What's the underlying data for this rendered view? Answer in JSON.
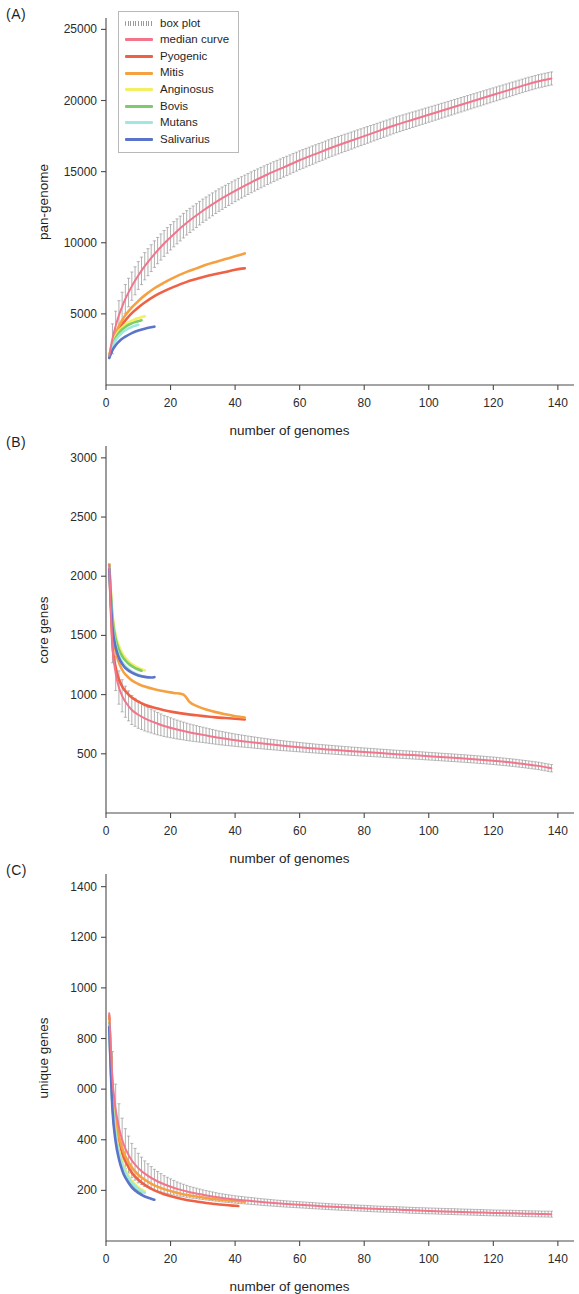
{
  "figure": {
    "xlabel": "number of genomes",
    "panels": [
      {
        "letter": "(A)",
        "ylabel": "pan-genome"
      },
      {
        "letter": "(B)",
        "ylabel": "core genes"
      },
      {
        "letter": "(C)",
        "ylabel": "unique genes"
      }
    ]
  },
  "legend": {
    "entries": [
      {
        "label": "box plot",
        "color": "#9a9a9a",
        "style": "boxplot"
      },
      {
        "label": "median curve",
        "color": "#f2758c",
        "style": "line"
      },
      {
        "label": "Pyogenic",
        "color": "#ef6145",
        "style": "line"
      },
      {
        "label": "Mitis",
        "color": "#f5a142",
        "style": "line"
      },
      {
        "label": "Anginosus",
        "color": "#f2ef62",
        "style": "line"
      },
      {
        "label": "Bovis",
        "color": "#7dcb6a",
        "style": "line"
      },
      {
        "label": "Mutans",
        "color": "#9fe8e0",
        "style": "line"
      },
      {
        "label": "Salivarius",
        "color": "#5b74c8",
        "style": "line"
      }
    ]
  },
  "chart_data": [
    {
      "panel": "A",
      "type": "line",
      "title": "pan-genome",
      "xlabel": "number of genomes",
      "ylabel": "pan-genome",
      "xlim": [
        0,
        145
      ],
      "ylim": [
        0,
        25800
      ],
      "xticks": [
        0,
        20,
        40,
        60,
        80,
        100,
        120,
        140
      ],
      "yticks": [
        5000,
        10000,
        15000,
        20000,
        25000
      ],
      "ytick_labels": [
        "5000",
        "10000",
        "15000",
        "20000",
        "25000"
      ],
      "grid": false,
      "legend_position": "top-left",
      "series": [
        {
          "name": "median curve",
          "color": "#f2758c",
          "has_boxplot": true,
          "x": [
            1,
            2,
            3,
            4,
            5,
            6,
            8,
            10,
            12,
            15,
            18,
            21,
            25,
            30,
            35,
            40,
            45,
            50,
            55,
            60,
            65,
            70,
            75,
            80,
            85,
            90,
            95,
            100,
            105,
            110,
            115,
            120,
            125,
            130,
            134,
            138
          ],
          "y": [
            2050,
            3250,
            4150,
            4900,
            5500,
            6050,
            6950,
            7700,
            8350,
            9200,
            9950,
            10600,
            11400,
            12250,
            13000,
            13650,
            14250,
            14800,
            15300,
            15800,
            16250,
            16700,
            17100,
            17500,
            17900,
            18300,
            18650,
            19000,
            19350,
            19700,
            20050,
            20400,
            20750,
            21100,
            21350,
            21550
          ]
        },
        {
          "name": "Pyogenic",
          "color": "#ef6145",
          "x": [
            1,
            2,
            3,
            4,
            5,
            6,
            8,
            10,
            12,
            15,
            18,
            21,
            25,
            28,
            31,
            34,
            37,
            40,
            42,
            43
          ],
          "y": [
            2000,
            2850,
            3450,
            3900,
            4250,
            4550,
            5050,
            5450,
            5800,
            6250,
            6600,
            6900,
            7250,
            7450,
            7650,
            7800,
            7950,
            8100,
            8180,
            8200
          ]
        },
        {
          "name": "Mitis",
          "color": "#f5a142",
          "x": [
            1,
            2,
            3,
            4,
            5,
            6,
            8,
            10,
            12,
            15,
            18,
            21,
            25,
            28,
            31,
            34,
            37,
            40,
            42,
            43
          ],
          "y": [
            2050,
            3000,
            3650,
            4150,
            4550,
            4900,
            5450,
            5900,
            6300,
            6800,
            7200,
            7550,
            7950,
            8200,
            8450,
            8650,
            8850,
            9050,
            9180,
            9250
          ]
        },
        {
          "name": "Anginosus",
          "color": "#f2ef62",
          "x": [
            1,
            2,
            3,
            4,
            5,
            6,
            7,
            8,
            9,
            10,
            11,
            12
          ],
          "y": [
            2050,
            2900,
            3450,
            3800,
            4050,
            4250,
            4400,
            4520,
            4620,
            4700,
            4770,
            4830
          ]
        },
        {
          "name": "Bovis",
          "color": "#7dcb6a",
          "x": [
            1,
            2,
            3,
            4,
            5,
            6,
            7,
            8,
            9,
            10,
            11
          ],
          "y": [
            2000,
            2800,
            3300,
            3650,
            3900,
            4080,
            4220,
            4330,
            4420,
            4490,
            4550
          ]
        },
        {
          "name": "Mutans",
          "color": "#9fe8e0",
          "x": [
            1,
            2,
            3,
            4,
            5,
            6,
            7,
            8,
            9,
            10
          ],
          "y": [
            1950,
            2700,
            3150,
            3450,
            3680,
            3850,
            3980,
            4080,
            4160,
            4230
          ]
        },
        {
          "name": "Salivarius",
          "color": "#5b74c8",
          "x": [
            1,
            2,
            3,
            4,
            5,
            6,
            8,
            10,
            12,
            14,
            15
          ],
          "y": [
            1900,
            2450,
            2800,
            3050,
            3250,
            3400,
            3650,
            3830,
            3960,
            4060,
            4100
          ]
        }
      ],
      "boxplot_note": "vertical whisker bars straddle the median curve across x = 2..138"
    },
    {
      "panel": "B",
      "type": "line",
      "title": "core genes",
      "xlabel": "number of genomes",
      "ylabel": "core genes",
      "xlim": [
        0,
        145
      ],
      "ylim": [
        0,
        3100
      ],
      "xticks": [
        0,
        20,
        40,
        60,
        80,
        100,
        120,
        140
      ],
      "yticks": [
        500,
        1000,
        1500,
        2000,
        2500,
        3000
      ],
      "ytick_labels": [
        "500",
        "1000",
        "1500",
        "2000",
        "2500",
        "3000"
      ],
      "grid": false,
      "legend_position": "none",
      "series": [
        {
          "name": "median curve",
          "color": "#f2758c",
          "has_boxplot": true,
          "x": [
            1,
            2,
            3,
            4,
            5,
            6,
            8,
            10,
            12,
            15,
            18,
            22,
            26,
            30,
            35,
            40,
            45,
            50,
            55,
            60,
            65,
            70,
            75,
            80,
            85,
            90,
            95,
            100,
            105,
            110,
            115,
            120,
            125,
            130,
            134,
            138
          ],
          "y": [
            2100,
            1420,
            1180,
            1060,
            990,
            940,
            870,
            830,
            800,
            765,
            735,
            705,
            680,
            660,
            635,
            615,
            598,
            582,
            568,
            556,
            544,
            534,
            524,
            515,
            506,
            497,
            489,
            480,
            471,
            462,
            452,
            441,
            428,
            412,
            398,
            378
          ]
        },
        {
          "name": "Pyogenic",
          "color": "#ef6145",
          "x": [
            1,
            2,
            3,
            4,
            5,
            6,
            8,
            10,
            12,
            15,
            18,
            21,
            25,
            28,
            31,
            34,
            37,
            40,
            42,
            43
          ],
          "y": [
            2100,
            1430,
            1230,
            1130,
            1070,
            1030,
            975,
            940,
            915,
            888,
            868,
            852,
            835,
            825,
            816,
            808,
            802,
            796,
            792,
            790
          ]
        },
        {
          "name": "Mitis",
          "color": "#f5a142",
          "x": [
            1,
            2,
            3,
            4,
            5,
            6,
            8,
            10,
            12,
            15,
            18,
            21,
            24,
            26,
            28,
            31,
            34,
            37,
            40,
            42,
            43
          ],
          "y": [
            2100,
            1560,
            1370,
            1270,
            1210,
            1170,
            1120,
            1090,
            1068,
            1045,
            1028,
            1014,
            1000,
            935,
            905,
            875,
            852,
            834,
            818,
            810,
            806
          ]
        },
        {
          "name": "Anginosus",
          "color": "#f2ef62",
          "x": [
            1,
            2,
            3,
            4,
            5,
            6,
            7,
            8,
            9,
            10,
            11,
            12
          ],
          "y": [
            2100,
            1680,
            1500,
            1410,
            1350,
            1310,
            1280,
            1258,
            1240,
            1226,
            1214,
            1205
          ]
        },
        {
          "name": "Bovis",
          "color": "#7dcb6a",
          "x": [
            1,
            2,
            3,
            4,
            5,
            6,
            7,
            8,
            9,
            10,
            11
          ],
          "y": [
            2090,
            1650,
            1470,
            1380,
            1325,
            1288,
            1260,
            1240,
            1224,
            1212,
            1202
          ]
        },
        {
          "name": "Mutans",
          "color": "#9fe8e0",
          "x": [
            1,
            2,
            3,
            4,
            5,
            6,
            7,
            8,
            9,
            10,
            11,
            12
          ],
          "y": [
            2080,
            1600,
            1420,
            1330,
            1276,
            1240,
            1214,
            1195,
            1180,
            1168,
            1158,
            1150
          ]
        },
        {
          "name": "Salivarius",
          "color": "#5b74c8",
          "x": [
            1,
            2,
            3,
            4,
            5,
            6,
            8,
            10,
            12,
            14,
            15
          ],
          "y": [
            2060,
            1570,
            1400,
            1312,
            1260,
            1225,
            1185,
            1162,
            1150,
            1145,
            1148
          ]
        }
      ],
      "boxplot_note": "vertical whisker bars straddle the median curve across x = 2..138"
    },
    {
      "panel": "C",
      "type": "line",
      "title": "unique genes",
      "xlabel": "number of genomes",
      "ylabel": "unique genes",
      "xlim": [
        0,
        145
      ],
      "ylim": [
        0,
        1450
      ],
      "xticks": [
        0,
        20,
        40,
        60,
        80,
        100,
        120,
        140
      ],
      "yticks": [
        200,
        600,
        800,
        1000,
        1200,
        1400
      ],
      "ytick_labels": [
        "200",
        "400",
        "000",
        "800",
        "1000",
        "1200",
        "1400"
      ],
      "ytick_values": [
        200,
        400,
        600,
        800,
        1000,
        1200,
        1400
      ],
      "grid": false,
      "legend_position": "none",
      "series": [
        {
          "name": "median curve",
          "color": "#f2758c",
          "has_boxplot": true,
          "x": [
            1,
            2,
            3,
            4,
            5,
            6,
            8,
            10,
            12,
            15,
            18,
            22,
            26,
            30,
            35,
            40,
            45,
            50,
            55,
            60,
            65,
            70,
            75,
            80,
            85,
            90,
            95,
            100,
            105,
            110,
            115,
            120,
            125,
            130,
            134,
            138
          ],
          "y": [
            900,
            640,
            520,
            450,
            400,
            365,
            318,
            288,
            266,
            242,
            224,
            206,
            193,
            183,
            172,
            164,
            158,
            152,
            147,
            143,
            139,
            135,
            132,
            129,
            126,
            124,
            121,
            119,
            117,
            115,
            113,
            111,
            110,
            108,
            107,
            106
          ]
        },
        {
          "name": "Pyogenic",
          "color": "#ef6145",
          "x": [
            1,
            2,
            3,
            4,
            5,
            6,
            8,
            10,
            12,
            15,
            18,
            21,
            25,
            28,
            31,
            34,
            37,
            40,
            41
          ],
          "y": [
            880,
            590,
            465,
            395,
            348,
            315,
            270,
            242,
            222,
            200,
            185,
            174,
            162,
            156,
            150,
            146,
            142,
            139,
            138
          ]
        },
        {
          "name": "Mitis",
          "color": "#f5a142",
          "x": [
            1,
            2,
            3,
            4,
            5,
            6,
            8,
            10,
            12,
            15,
            18,
            21,
            25,
            28,
            31,
            34,
            37,
            40,
            42,
            43
          ],
          "y": [
            890,
            610,
            485,
            415,
            368,
            335,
            290,
            262,
            242,
            220,
            205,
            194,
            182,
            176,
            170,
            165,
            161,
            158,
            156,
            155
          ]
        },
        {
          "name": "Anginosus",
          "color": "#f2ef62",
          "x": [
            1,
            2,
            3,
            4,
            5,
            6,
            7,
            8,
            9,
            10,
            11,
            12
          ],
          "y": [
            870,
            560,
            430,
            358,
            312,
            280,
            256,
            238,
            224,
            212,
            203,
            196
          ]
        },
        {
          "name": "Bovis",
          "color": "#7dcb6a",
          "x": [
            1,
            2,
            3,
            4,
            5,
            6,
            7,
            8,
            9,
            10,
            11
          ],
          "y": [
            860,
            540,
            412,
            342,
            296,
            265,
            242,
            224,
            210,
            199,
            190
          ]
        },
        {
          "name": "Mutans",
          "color": "#9fe8e0",
          "x": [
            1,
            2,
            3,
            4,
            5,
            6,
            7,
            8,
            9,
            10,
            11,
            12
          ],
          "y": [
            855,
            545,
            418,
            348,
            303,
            272,
            249,
            231,
            217,
            206,
            197,
            190
          ]
        },
        {
          "name": "Salivarius",
          "color": "#5b74c8",
          "x": [
            1,
            2,
            3,
            4,
            5,
            6,
            8,
            10,
            12,
            14,
            15
          ],
          "y": [
            845,
            520,
            392,
            324,
            280,
            250,
            212,
            190,
            176,
            167,
            163
          ]
        }
      ],
      "boxplot_note": "vertical whisker bars straddle the median curve across x = 2..138"
    }
  ]
}
